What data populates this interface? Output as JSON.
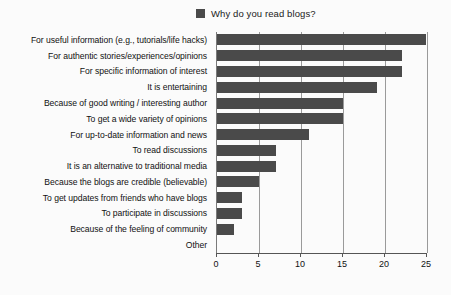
{
  "legend": {
    "label": "Why do you read blogs?",
    "swatch_icon": "square-swatch-icon",
    "color": "#4a4a4a",
    "position": "top-center"
  },
  "chart_data": {
    "type": "bar",
    "orientation": "horizontal",
    "title": "Why do you read blogs?",
    "xlabel": "",
    "ylabel": "",
    "xlim": [
      0,
      25
    ],
    "xticks": [
      0,
      5,
      10,
      15,
      20,
      25
    ],
    "grid": true,
    "legend": [
      "Why do you read blogs?"
    ],
    "bar_color": "#4a4a4a",
    "categories": [
      "For useful information (e.g., tutorials/life hacks)",
      "For authentic stories/experiences/opinions",
      "For specific information of interest",
      "It is entertaining",
      "Because of good writing / interesting author",
      "To get a wide variety of opinions",
      "For up-to-date information and news",
      "To read discussions",
      "It is an alternative to traditional media",
      "Because the blogs are credible (believable)",
      "To get updates from friends who have blogs",
      "To participate in discussions",
      "Because of the feeling of community",
      "Other"
    ],
    "values": [
      25,
      22,
      22,
      19,
      15,
      15,
      11,
      7,
      7,
      5,
      3,
      3,
      2,
      0
    ]
  }
}
